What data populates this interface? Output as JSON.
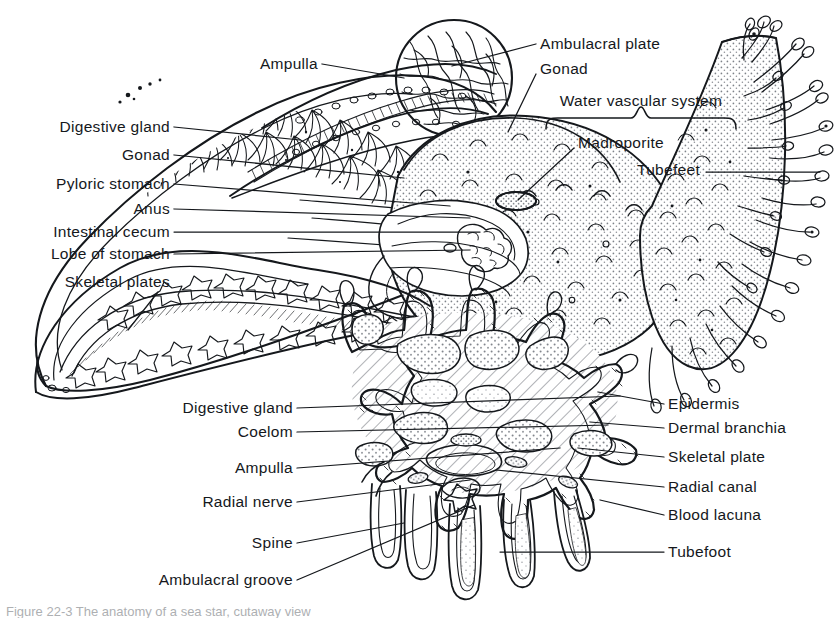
{
  "figure": {
    "background_color": "#ffffff",
    "ink_color": "#15181c",
    "stipple_color": "#8d9096",
    "hatch_color": "#6f737a",
    "caption_partial": "Figure  22-3   The  anatomy  of  a  sea  star,  cutaway  view"
  },
  "labels": {
    "top": [
      {
        "id": "ampulla-top",
        "text": "Ampulla",
        "align": "right",
        "x": 318,
        "y": 64,
        "leader": [
          [
            322,
            64
          ],
          [
            404,
            78
          ]
        ]
      },
      {
        "id": "ambulacral-plate",
        "text": "Ambulacral plate",
        "align": "left",
        "x": 540,
        "y": 44,
        "leader": [
          [
            536,
            44
          ],
          [
            452,
            66
          ]
        ]
      },
      {
        "id": "gonad-top",
        "text": "Gonad",
        "align": "left",
        "x": 540,
        "y": 69,
        "leader": [
          [
            536,
            74
          ],
          [
            508,
            132
          ]
        ]
      },
      {
        "id": "water-vascular",
        "text": "Water vascular system",
        "align": "center",
        "x": 641,
        "y": 101,
        "leader": []
      },
      {
        "id": "madroporite",
        "text": "Madroporite",
        "align": "left",
        "x": 578,
        "y": 143,
        "leader": [
          [
            574,
            148
          ],
          [
            518,
            200
          ]
        ]
      },
      {
        "id": "tubefeet",
        "text": "Tubefeet",
        "align": "left",
        "x": 637,
        "y": 170,
        "leader": [
          [
            706,
            172
          ],
          [
            820,
            172
          ]
        ]
      }
    ],
    "left": [
      {
        "id": "digestive-gland-1",
        "text": "Digestive gland",
        "x": 170,
        "y": 127,
        "leader": [
          [
            174,
            127
          ],
          [
            300,
            140
          ]
        ]
      },
      {
        "id": "gonad-left",
        "text": "Gonad",
        "x": 170,
        "y": 155,
        "leader": [
          [
            174,
            155
          ],
          [
            404,
            178
          ]
        ]
      },
      {
        "id": "pyloric-stomach",
        "text": "Pyloric stomach",
        "x": 170,
        "y": 184,
        "leader": [
          [
            174,
            184
          ],
          [
            450,
            206
          ]
        ]
      },
      {
        "id": "anus",
        "text": "Anus",
        "x": 170,
        "y": 209,
        "leader": [
          [
            174,
            209
          ],
          [
            470,
            218
          ]
        ]
      },
      {
        "id": "intestinal-cecum",
        "text": "Intestinal cecum",
        "x": 170,
        "y": 232,
        "leader": [
          [
            174,
            232
          ],
          [
            480,
            232
          ]
        ]
      },
      {
        "id": "lobe-of-stomach",
        "text": "Lobe of stomach",
        "x": 170,
        "y": 254,
        "leader": [
          [
            174,
            254
          ],
          [
            470,
            250
          ]
        ]
      },
      {
        "id": "skeletal-plates",
        "text": "Skeletal plates",
        "x": 170,
        "y": 282,
        "leader": [
          [
            158,
            292
          ],
          [
            128,
            330
          ]
        ]
      }
    ],
    "lower_left": [
      {
        "id": "digestive-gland-2",
        "text": "Digestive gland",
        "x": 293,
        "y": 408,
        "leader": [
          [
            297,
            408
          ],
          [
            620,
            396
          ]
        ]
      },
      {
        "id": "coelom",
        "text": "Coelom",
        "x": 293,
        "y": 432,
        "leader": [
          [
            297,
            432
          ],
          [
            608,
            425
          ]
        ]
      },
      {
        "id": "ampulla-lower",
        "text": "Ampulla",
        "x": 293,
        "y": 468,
        "leader": [
          [
            297,
            468
          ],
          [
            560,
            448
          ]
        ]
      },
      {
        "id": "radial-nerve",
        "text": "Radial nerve",
        "x": 293,
        "y": 502,
        "leader": [
          [
            297,
            502
          ],
          [
            470,
            480
          ]
        ]
      },
      {
        "id": "spine",
        "text": "Spine",
        "x": 293,
        "y": 543,
        "leader": [
          [
            297,
            543
          ],
          [
            404,
            523
          ]
        ]
      },
      {
        "id": "ambulacral-groove",
        "text": "Ambulacral groove",
        "x": 293,
        "y": 580,
        "leader": [
          [
            297,
            580
          ],
          [
            474,
            505
          ]
        ]
      }
    ],
    "right": [
      {
        "id": "epidermis",
        "text": "Epidermis",
        "x": 668,
        "y": 404,
        "leader": [
          [
            664,
            404
          ],
          [
            598,
            392
          ]
        ]
      },
      {
        "id": "dermal-branchia",
        "text": "Dermal branchia",
        "x": 668,
        "y": 428,
        "leader": [
          [
            664,
            428
          ],
          [
            590,
            422
          ]
        ]
      },
      {
        "id": "skeletal-plate",
        "text": "Skeletal plate",
        "x": 668,
        "y": 457,
        "leader": [
          [
            664,
            457
          ],
          [
            578,
            448
          ]
        ]
      },
      {
        "id": "radial-canal",
        "text": "Radial canal",
        "x": 668,
        "y": 487,
        "leader": [
          [
            664,
            487
          ],
          [
            496,
            470
          ]
        ]
      },
      {
        "id": "blood-lacuna",
        "text": "Blood lacuna",
        "x": 668,
        "y": 515,
        "leader": [
          [
            664,
            515
          ],
          [
            600,
            500
          ]
        ]
      },
      {
        "id": "tubefoot",
        "text": "Tubefoot",
        "x": 668,
        "y": 552,
        "leader": [
          [
            664,
            552
          ],
          [
            500,
            552
          ]
        ]
      }
    ],
    "brace": {
      "id": "water-vascular-brace",
      "x1": 546,
      "y": 118,
      "x2": 736,
      "depth": 11
    }
  }
}
